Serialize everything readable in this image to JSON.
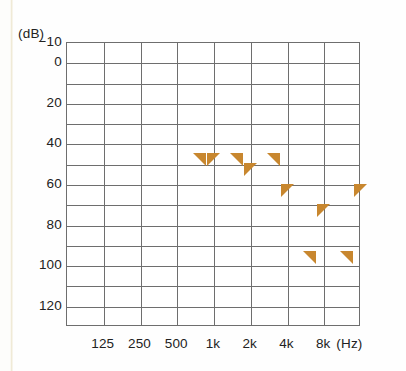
{
  "chart_data": {
    "type": "scatter",
    "title": "",
    "xlabel": "Hz",
    "ylabel": "dB",
    "unit_label_y": "(dB)",
    "unit_label_x": "(Hz)",
    "grid": true,
    "legend_position": "none",
    "xlim_categories": [
      "125",
      "250",
      "500",
      "1k",
      "2k",
      "4k",
      "8k"
    ],
    "ylim": [
      -10,
      130
    ],
    "ytick_labels": [
      "-10",
      "0",
      "20",
      "40",
      "60",
      "80",
      "100",
      "120"
    ],
    "ytick_values": [
      -10,
      0,
      20,
      40,
      60,
      80,
      100,
      120
    ],
    "ygrid_step": 10,
    "xtick_labels": [
      "125",
      "250",
      "500",
      "1k",
      "2k",
      "4k",
      "8k"
    ],
    "series": [
      {
        "name": "Left bone conduction",
        "symbol": "left-triangle",
        "color": "#c8872f",
        "points": [
          {
            "x": "250",
            "y": 30
          },
          {
            "x": "500",
            "y": 30
          },
          {
            "x": "1k",
            "y": 30
          },
          {
            "x": "2k",
            "y": 78
          },
          {
            "x": "4k",
            "y": 78
          }
        ]
      },
      {
        "name": "Right bone conduction",
        "symbol": "right-triangle",
        "color": "#c8872f",
        "points": [
          {
            "x": "250",
            "y": 30
          },
          {
            "x": "500",
            "y": 35
          },
          {
            "x": "1k",
            "y": 45
          },
          {
            "x": "2k",
            "y": 55
          },
          {
            "x": "4k",
            "y": 45
          }
        ]
      }
    ]
  },
  "axis": {
    "y_unit": "(dB)",
    "y_ticks": [
      "-10",
      "0",
      "20",
      "40",
      "60",
      "80",
      "100",
      "120"
    ],
    "x_ticks": [
      "125",
      "250",
      "500",
      "1k",
      "2k",
      "4k",
      "8k"
    ],
    "x_unit": "(Hz)"
  },
  "colors": {
    "marker": "#c8872f",
    "grid": "#6e6e6e",
    "text": "#222222",
    "background": "#ffffff"
  }
}
